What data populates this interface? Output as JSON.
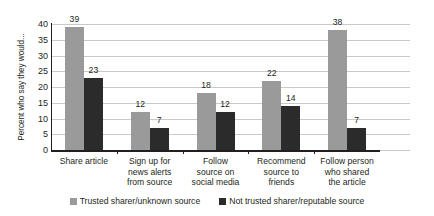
{
  "chart_data": {
    "type": "bar",
    "title": "",
    "subtitle": "",
    "xlabel": "",
    "ylabel": "Percent who say they would...",
    "ylim": [
      0,
      40
    ],
    "ytick_step": 5,
    "ytick_labels": [
      "40",
      "35",
      "30",
      "25",
      "20",
      "15",
      "10",
      "5",
      "0"
    ],
    "grid": true,
    "legend_position": "bottom",
    "categories": [
      "Share article",
      "Sign up for news alerts from source",
      "Follow source on social media",
      "Recommend source to friends",
      "Follow person who shared the article"
    ],
    "category_lines": [
      [
        "Share article"
      ],
      [
        "Sign up for",
        "news alerts",
        "from source"
      ],
      [
        "Follow",
        "source on",
        "social media"
      ],
      [
        "Recommend",
        "source to",
        "friends"
      ],
      [
        "Follow person",
        "who shared",
        "the article"
      ]
    ],
    "series": [
      {
        "name": "Trusted sharer/unknown source",
        "color": "#9a9a9a",
        "values": [
          39,
          12,
          18,
          22,
          38
        ]
      },
      {
        "name": "Not trusted sharer/reputable source",
        "color": "#2b2b2b",
        "values": [
          23,
          7,
          12,
          14,
          7
        ]
      }
    ]
  },
  "legend": {
    "items": [
      {
        "label": "Trusted sharer/unknown source"
      },
      {
        "label": "Not trusted sharer/reputable source"
      }
    ]
  }
}
